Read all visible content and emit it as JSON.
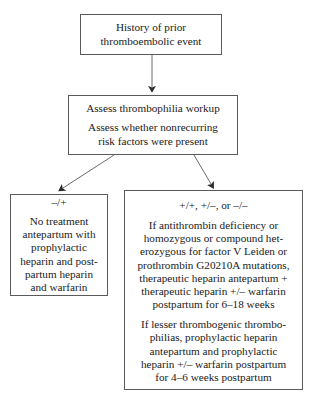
{
  "diagram": {
    "nodes": {
      "history": {
        "label": "History of prior\nthromboembolic event"
      },
      "assess": {
        "line1": "Assess thrombophilia workup",
        "line2": "Assess whether nonrecurring\nrisk factors were present"
      },
      "negative": {
        "genotype": "–/+",
        "body": "No treatment\nantepartum with\nprophylactic\nheparin and post-\npartum heparin\nand warfarin"
      },
      "positive": {
        "genotype": "+/+, +/–, or –/–",
        "body1": "If antithrombin deficiency or\nhomozygous or compound het-\nerozygous for factor V Leiden or\nprothrombin G20210A mutations,\ntherapeutic heparin antepartum +\ntherapeutic heparin +/– warfarin\npostpartum for 6–18 weeks",
        "body2": "If lesser thrombogenic thrombo-\nphilias, prophylactic heparin\nantepartum and prophylactic\nheparin +/– warfarin postpartum\nfor 4–6 weeks postpartum"
      }
    },
    "edges": [
      {
        "name": "history-to-assess",
        "from": "history",
        "to": "assess"
      },
      {
        "name": "assess-to-negative",
        "from": "assess",
        "to": "negative"
      },
      {
        "name": "assess-to-positive",
        "from": "assess",
        "to": "positive"
      }
    ],
    "colors": {
      "border": "#5a5a5a",
      "text": "#1a1a1a",
      "arrow": "#3a3a3a",
      "background": "#ffffff"
    }
  }
}
